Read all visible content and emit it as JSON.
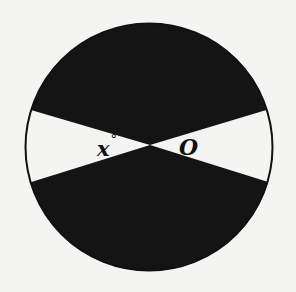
{
  "diagram": {
    "type": "circle-with-shaded-sectors",
    "background_color": "#f4f4f2",
    "circle": {
      "center": [
        149,
        147
      ],
      "radius": 124,
      "fill_color": "#141414",
      "stroke_color": "#111111"
    },
    "center_point": [
      150,
      145
    ],
    "white_sectors": [
      {
        "name": "left-sector",
        "fill_color": "#f4f4f2",
        "points": [
          [
            150,
            145
          ],
          [
            30,
            110
          ],
          [
            34,
            183
          ]
        ]
      },
      {
        "name": "right-sector",
        "fill_color": "#f4f4f2",
        "points": [
          [
            150,
            145
          ],
          [
            267,
            109
          ],
          [
            266,
            182
          ]
        ]
      }
    ],
    "labels": {
      "angle_variable": "x",
      "angle_unit": "°",
      "center": "O"
    }
  }
}
